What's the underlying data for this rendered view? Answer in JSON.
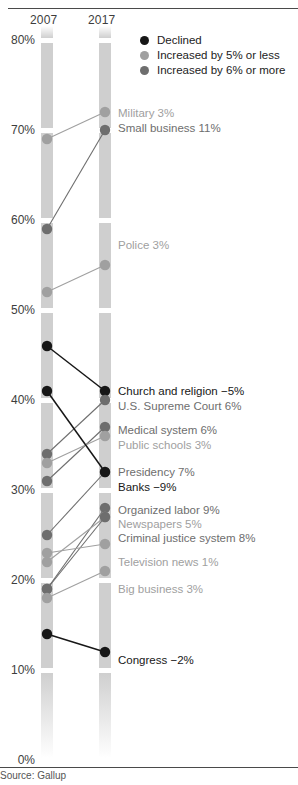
{
  "source": "Source: Gallup",
  "columns": {
    "left": "2007",
    "right": "2017"
  },
  "axis": {
    "unit": "%",
    "ticks": [
      "80%",
      "70%",
      "60%",
      "50%",
      "40%",
      "30%",
      "20%",
      "10%",
      "0%"
    ],
    "tick_values": [
      80,
      70,
      60,
      50,
      40,
      30,
      20,
      10,
      0
    ],
    "min": 0,
    "max": 80
  },
  "colors": {
    "declined": "#171717",
    "increased_small": "#a0a0a0",
    "increased_big": "#6e6e6e",
    "band": "#cfcfcf",
    "rule": "#4a4a4a",
    "text": "#1c1c1c"
  },
  "legend": {
    "position": "top-right",
    "items": [
      {
        "label": "Declined",
        "color": "#171717",
        "key": "declined"
      },
      {
        "label": "Increased by 5% or less",
        "color": "#a0a0a0",
        "key": "increased_small"
      },
      {
        "label": "Increased by 6% or more",
        "color": "#6e6e6e",
        "key": "increased_big"
      }
    ]
  },
  "chart_data": {
    "type": "line",
    "subtype": "slopegraph",
    "xlabel": "",
    "ylabel": "",
    "x": [
      "2007",
      "2017"
    ],
    "ylim": [
      0,
      80
    ],
    "grid": true,
    "legend_position": "top-right",
    "series": [
      {
        "name": "Military",
        "label": "Military 3%",
        "delta": 3,
        "values": [
          69,
          72
        ],
        "category": "increased_small"
      },
      {
        "name": "Small business",
        "label": "Small business 11%",
        "delta": 11,
        "values": [
          59,
          70
        ],
        "category": "increased_big"
      },
      {
        "name": "Police",
        "label": "Police 3%",
        "delta": 3,
        "values": [
          52,
          55
        ],
        "category": "increased_small"
      },
      {
        "name": "Church and religion",
        "label": "Church and religion −5%",
        "delta": -5,
        "values": [
          46,
          41
        ],
        "category": "declined"
      },
      {
        "name": "U.S. Supreme Court",
        "label": "U.S. Supreme Court 6%",
        "delta": 6,
        "values": [
          34,
          40
        ],
        "category": "increased_big"
      },
      {
        "name": "Medical system",
        "label": "Medical system 6%",
        "delta": 6,
        "values": [
          31,
          37
        ],
        "category": "increased_big"
      },
      {
        "name": "Public schools",
        "label": "Public schools 3%",
        "delta": 3,
        "values": [
          33,
          36
        ],
        "category": "increased_small"
      },
      {
        "name": "Presidency",
        "label": "Presidency 7%",
        "delta": 7,
        "values": [
          25,
          32
        ],
        "category": "increased_big"
      },
      {
        "name": "Banks",
        "label": "Banks −9%",
        "delta": -9,
        "values": [
          41,
          32
        ],
        "category": "declined"
      },
      {
        "name": "Organized labor",
        "label": "Organized labor 9%",
        "delta": 9,
        "values": [
          19,
          28
        ],
        "category": "increased_big"
      },
      {
        "name": "Newspapers",
        "label": "Newspapers 5%",
        "delta": 5,
        "values": [
          22,
          27
        ],
        "category": "increased_small"
      },
      {
        "name": "Criminal justice system",
        "label": "Criminal justice system 8%",
        "delta": 8,
        "values": [
          19,
          27
        ],
        "category": "increased_big"
      },
      {
        "name": "Television news",
        "label": "Television news 1%",
        "delta": 1,
        "values": [
          23,
          24
        ],
        "category": "increased_small"
      },
      {
        "name": "Big business",
        "label": "Big business 3%",
        "delta": 3,
        "values": [
          18,
          21
        ],
        "category": "increased_small"
      },
      {
        "name": "Congress",
        "label": "Congress −2%",
        "delta": -2,
        "values": [
          14,
          12
        ],
        "category": "declined"
      }
    ]
  },
  "label_layout": [
    {
      "series": "Military",
      "top": 107
    },
    {
      "series": "Small business",
      "top": 122
    },
    {
      "series": "Police",
      "top": 239
    },
    {
      "series": "Church and religion",
      "top": 385
    },
    {
      "series": "U.S. Supreme Court",
      "top": 400
    },
    {
      "series": "Medical system",
      "top": 424
    },
    {
      "series": "Public schools",
      "top": 439
    },
    {
      "series": "Presidency",
      "top": 466
    },
    {
      "series": "Banks",
      "top": 481
    },
    {
      "series": "Organized labor",
      "top": 504
    },
    {
      "series": "Newspapers",
      "top": 518
    },
    {
      "series": "Criminal justice system",
      "top": 532
    },
    {
      "series": "Television news",
      "top": 556
    },
    {
      "series": "Big business",
      "top": 583
    },
    {
      "series": "Congress",
      "top": 654
    }
  ]
}
